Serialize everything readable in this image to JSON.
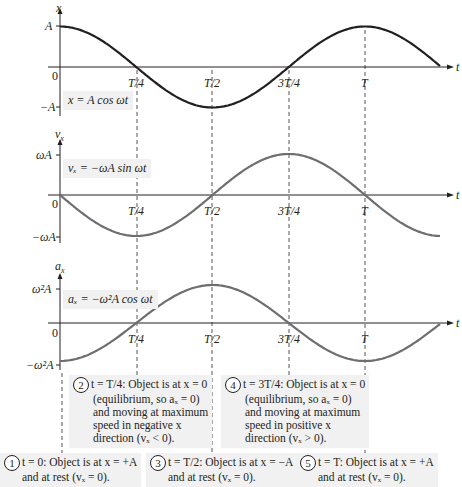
{
  "chart_data": [
    {
      "type": "line",
      "title": "x = A cos ωt",
      "ylabel": "x",
      "xlabel": "t",
      "x_ticks": [
        "0",
        "T/4",
        "T/2",
        "3T/4",
        "T"
      ],
      "y_ticks": [
        "A",
        "-A"
      ],
      "x": [
        0,
        0.25,
        0.5,
        0.75,
        1.0,
        1.25
      ],
      "values": [
        1,
        0,
        -1,
        0,
        1,
        0
      ],
      "curve_color": "#231f20"
    },
    {
      "type": "line",
      "title": "v_x = -ωA sin ωt",
      "ylabel": "v_x",
      "xlabel": "t",
      "x_ticks": [
        "0",
        "T/4",
        "T/2",
        "3T/4",
        "T"
      ],
      "y_ticks": [
        "ωA",
        "-ωA"
      ],
      "x": [
        0,
        0.25,
        0.5,
        0.75,
        1.0,
        1.25
      ],
      "values": [
        0,
        -1,
        0,
        1,
        0,
        -1
      ],
      "curve_color": "#6d6e71"
    },
    {
      "type": "line",
      "title": "a_x = -ω²A cos ωt",
      "ylabel": "a_x",
      "xlabel": "t",
      "x_ticks": [
        "0",
        "T/4",
        "T/2",
        "3T/4",
        "T"
      ],
      "y_ticks": [
        "ω²A",
        "-ω²A"
      ],
      "x": [
        0,
        0.25,
        0.5,
        0.75,
        1.0,
        1.25
      ],
      "values": [
        -1,
        0,
        1,
        0,
        -1,
        0
      ],
      "curve_color": "#6d6e71"
    }
  ],
  "graphs": {
    "g1": {
      "ylabel": "x",
      "top": "A",
      "bottom": "−A",
      "zero": "0",
      "t": "t",
      "eq": "x = A cos ωt"
    },
    "g2": {
      "ylabel": "v",
      "ysub": "x",
      "top": "ωA",
      "bottom": "−ωA",
      "zero": "0",
      "t": "t",
      "eq": "vₓ = −ωA sin ωt"
    },
    "g3": {
      "ylabel": "a",
      "ysub": "x",
      "top": "ω²A",
      "bottom": "−ω²A",
      "zero": "0",
      "t": "t",
      "eq": "aₓ = −ω²A cos ωt"
    }
  },
  "ticks": [
    "T/4",
    "T/2",
    "3T/4",
    "T"
  ],
  "callouts": [
    {
      "num": "1",
      "lines": [
        "t = 0: Object is at x = +A",
        "and at rest (vₓ = 0)."
      ]
    },
    {
      "num": "2",
      "lines": [
        "t = T/4: Object is at x = 0",
        "(equilibrium, so aₓ = 0)",
        "and moving at maximum",
        "speed in negative x",
        "direction (vₓ < 0)."
      ]
    },
    {
      "num": "3",
      "lines": [
        "t = T/2: Object is at x = −A",
        "and at rest (vₓ = 0)."
      ]
    },
    {
      "num": "4",
      "lines": [
        "t = 3T/4: Object is at x = 0",
        "(equilibrium, so aₓ = 0)",
        "and moving at maximum",
        "speed in positive x",
        "direction (vₓ > 0)."
      ]
    },
    {
      "num": "5",
      "lines": [
        "t = T: Object is at x = +A",
        "and at rest (vₓ = 0)."
      ]
    }
  ],
  "colors": {
    "ink": "#231f20",
    "curve_gray": "#6d6e71",
    "box_bg": "#f1f1f1",
    "dash": "#555555"
  }
}
